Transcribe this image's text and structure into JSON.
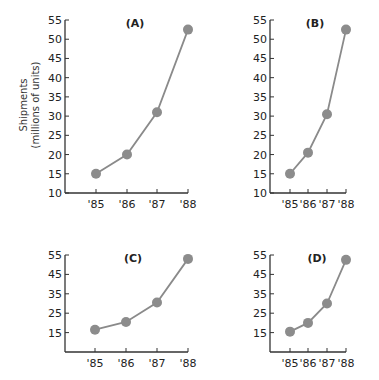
{
  "ylabel_line1": "Shipments",
  "ylabel_line2": "(millions of units)",
  "colors": {
    "line": "#8a8a8a",
    "marker": "#8c8c8c",
    "axis": "#333333"
  },
  "chart_data": [
    {
      "type": "line",
      "title": "(A)",
      "xlabel": "",
      "ylabel": "Shipments (millions of units)",
      "categories": [
        "'85",
        "'86",
        "'87",
        "'88"
      ],
      "values": [
        15,
        20,
        31,
        52.5
      ],
      "yticks": [
        10,
        15,
        20,
        25,
        30,
        35,
        40,
        45,
        50,
        55
      ],
      "ylim": [
        10,
        55
      ],
      "grid": false
    },
    {
      "type": "line",
      "title": "(B)",
      "xlabel": "",
      "ylabel": "",
      "categories": [
        "'85",
        "'86",
        "'87",
        "'88"
      ],
      "values": [
        15,
        20.5,
        30.5,
        52.5
      ],
      "yticks": [
        10,
        15,
        20,
        25,
        30,
        35,
        40,
        45,
        50,
        55
      ],
      "ylim": [
        10,
        55
      ],
      "grid": false
    },
    {
      "type": "line",
      "title": "(C)",
      "xlabel": "",
      "ylabel": "",
      "categories": [
        "'85",
        "'86",
        "'87",
        "'88"
      ],
      "values": [
        16.5,
        20.5,
        30.5,
        53
      ],
      "yticks": [
        15,
        25,
        35,
        45,
        55
      ],
      "ylim": [
        5,
        55
      ],
      "grid": false
    },
    {
      "type": "line",
      "title": "(D)",
      "xlabel": "",
      "ylabel": "",
      "categories": [
        "'85",
        "'86",
        "'87",
        "'88"
      ],
      "values": [
        15.5,
        20,
        30,
        52.5
      ],
      "yticks": [
        15,
        25,
        35,
        45,
        55
      ],
      "ylim": [
        5,
        55
      ],
      "grid": false
    }
  ]
}
